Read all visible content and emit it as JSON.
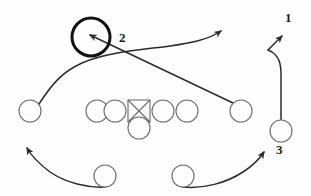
{
  "diagram": {
    "kind": "football-play-diagram",
    "background_color": "#fdfdfd",
    "stroke_color": "#2b2b2b",
    "offense_stroke_color": "#6b6b6b",
    "defender_stroke_color": "#111111",
    "width": 311,
    "height": 196,
    "labels": [
      {
        "id": "label-1",
        "text": "1",
        "x": 285,
        "y": 11
      },
      {
        "id": "label-2",
        "text": "2",
        "x": 119,
        "y": 31
      },
      {
        "id": "label-3",
        "text": "3",
        "x": 276,
        "y": 143
      }
    ],
    "offense": {
      "line": [
        {
          "id": "left-wide-receiver",
          "shape": "circle",
          "cx": 30,
          "cy": 111,
          "r": 11
        },
        {
          "id": "left-guard",
          "shape": "circle",
          "cx": 97,
          "cy": 111,
          "r": 11
        },
        {
          "id": "left-tackle",
          "shape": "circle",
          "cx": 115,
          "cy": 111,
          "r": 11
        },
        {
          "id": "center-ball-carrier",
          "shape": "square-with-x",
          "x": 128,
          "y": 100,
          "size": 22
        },
        {
          "id": "right-tackle",
          "shape": "circle",
          "cx": 163,
          "cy": 111,
          "r": 11
        },
        {
          "id": "right-guard",
          "shape": "circle",
          "cx": 187,
          "cy": 111,
          "r": 11
        },
        {
          "id": "right-wide-receiver",
          "shape": "circle",
          "cx": 241,
          "cy": 111,
          "r": 11
        }
      ],
      "backfield": [
        {
          "id": "quarterback",
          "shape": "circle",
          "cx": 139,
          "cy": 128,
          "r": 11
        },
        {
          "id": "left-back",
          "shape": "circle",
          "cx": 105,
          "cy": 176,
          "r": 11
        },
        {
          "id": "right-back",
          "shape": "circle",
          "cx": 183,
          "cy": 176,
          "r": 11
        },
        {
          "id": "right-slot-back-3",
          "shape": "circle",
          "cx": 281,
          "cy": 131,
          "r": 11
        }
      ]
    },
    "defenders": [
      {
        "id": "defender-2",
        "shape": "bold-circle",
        "cx": 91,
        "cy": 37,
        "r": 19
      }
    ],
    "routes": [
      {
        "id": "route-left-receiver-deep",
        "description": "left receiver arcs up and right to deep arrow"
      },
      {
        "id": "route-right-receiver-to-defender-2",
        "description": "right receiver runs diagonally up-left at defender 2"
      },
      {
        "id": "route-left-back-sweep",
        "description": "left back sweeps left and upfield"
      },
      {
        "id": "route-right-back-sweep",
        "description": "right back sweeps right and upfield"
      },
      {
        "id": "route-slot-back-3-up",
        "description": "slot back 3 runs straight up then breaks out to arrow 1"
      }
    ]
  }
}
